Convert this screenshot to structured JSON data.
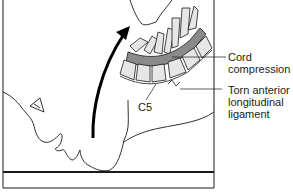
{
  "figure": {
    "type": "medical-illustration",
    "labels": {
      "cord": [
        "Cord",
        "compression"
      ],
      "ligament": [
        "Torn anterior",
        "longitudinal",
        "ligament"
      ],
      "vertebra": "C5"
    },
    "colors": {
      "line": "#1a1a1a",
      "cord": "#8a8a8a",
      "bone_fill": "#e6e6e6",
      "background": "#ffffff"
    }
  }
}
